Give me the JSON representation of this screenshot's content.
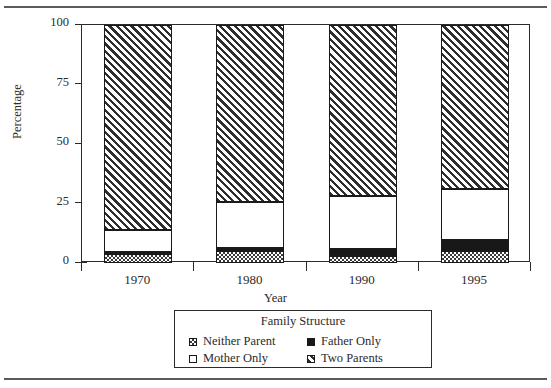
{
  "figure": {
    "clipped_caption_above": "",
    "rules": {
      "color": "#5b5b5b"
    }
  },
  "chart_data": {
    "type": "bar",
    "subtype": "stacked-100-percent",
    "title": "",
    "xlabel": "Year",
    "ylabel": "Percentage",
    "categories": [
      "1970",
      "1980",
      "1990",
      "1995"
    ],
    "ylim": [
      0,
      100
    ],
    "yticks": [
      0,
      25,
      50,
      75,
      100
    ],
    "ytick_labels": [
      "0",
      "25",
      "50",
      "75",
      "100"
    ],
    "grid": false,
    "legend_position": "below-plot",
    "legend_title": "Family Structure",
    "series": [
      {
        "name": "Neither Parent",
        "pattern": "checker",
        "color": "#3a3a3a",
        "values": [
          3.8,
          5.0,
          3.0,
          5.0
        ]
      },
      {
        "name": "Father Only",
        "pattern": "solid-black",
        "color": "#181818",
        "values": [
          1.0,
          1.2,
          3.0,
          4.5
        ]
      },
      {
        "name": "Mother Only",
        "pattern": "white",
        "color": "#ffffff",
        "values": [
          9.2,
          19.3,
          22.0,
          21.5
        ]
      },
      {
        "name": "Two Parents",
        "pattern": "diagonal-hatch",
        "color": "#2e2e2e",
        "values": [
          86.0,
          74.5,
          72.0,
          69.0
        ]
      }
    ]
  },
  "axes": {
    "y_title": "Percentage",
    "x_title": "Year",
    "yticks": [
      {
        "label": "100",
        "value": 100
      },
      {
        "label": "75",
        "value": 75
      },
      {
        "label": "50",
        "value": 50
      },
      {
        "label": "25",
        "value": 25
      },
      {
        "label": "0",
        "value": 0
      }
    ],
    "xticks": [
      {
        "label": "1970"
      },
      {
        "label": "1980"
      },
      {
        "label": "1990"
      },
      {
        "label": "1995"
      }
    ]
  },
  "legend": {
    "title": "Family Structure",
    "items": [
      {
        "label": "Neither Parent",
        "pattern": "checker"
      },
      {
        "label": "Father Only",
        "pattern": "solid-black"
      },
      {
        "label": "Mother Only",
        "pattern": "white"
      },
      {
        "label": "Two Parents",
        "pattern": "diagonal-hatch"
      }
    ]
  }
}
